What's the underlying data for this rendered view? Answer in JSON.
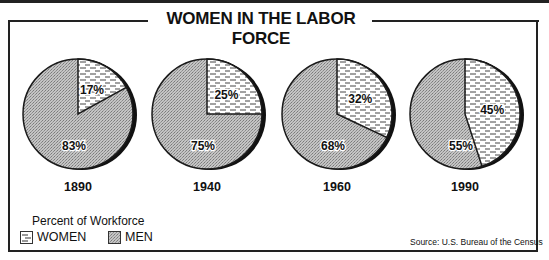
{
  "chart_data": {
    "type": "pie",
    "title": "WOMEN IN THE LABOR FORCE",
    "subtitle": "Percent of Workforce",
    "legend": [
      {
        "label": "WOMEN",
        "pattern": "dashed-lines"
      },
      {
        "label": "MEN",
        "pattern": "gray-stipple"
      }
    ],
    "legend_position": "bottom-left",
    "source": "Source: U.S. Bureau of the Census",
    "pies": [
      {
        "year": "1890",
        "women": 17,
        "men": 83
      },
      {
        "year": "1940",
        "women": 25,
        "men": 75
      },
      {
        "year": "1960",
        "women": 32,
        "men": 68
      },
      {
        "year": "1990",
        "women": 45,
        "men": 55
      }
    ]
  },
  "labels": {
    "title": "WOMEN IN THE LABOR FORCE",
    "legend_title": "Percent of Workforce",
    "legend_women": "WOMEN",
    "legend_men": "MEN",
    "source": "Source: U.S. Bureau of the Census",
    "years": [
      "1890",
      "1940",
      "1960",
      "1990"
    ],
    "women_pct": [
      "17%",
      "25%",
      "32%",
      "45%"
    ],
    "men_pct": [
      "83%",
      "75%",
      "68%",
      "55%"
    ]
  },
  "colors": {
    "men_fill": "#b8b8b8",
    "women_fill": "#ffffff",
    "outline": "#1a1a1a"
  }
}
